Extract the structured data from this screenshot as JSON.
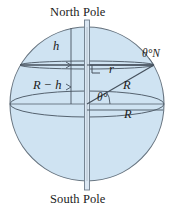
{
  "figure": {
    "name": "sphere-latitude-diagram",
    "colors": {
      "sphere_fill": "#cfe3f2",
      "outline": "#5a6a7a",
      "line": "#3f4a57",
      "axis_fill": "#dbe7f3",
      "text": "#1b1b1b"
    },
    "labels": {
      "north_pole": "North Pole",
      "south_pole": "South Pole",
      "height_above_latitude": "h",
      "distance_center_to_latitude": "R − h",
      "latitude_radius": "r",
      "sphere_radius_diagonal": "R",
      "sphere_radius_equator": "R",
      "latitude_angle_label": "θ°N",
      "center_angle": "θ°"
    },
    "geometry": {
      "sphere_center_x": 87,
      "sphere_center_y": 104,
      "sphere_radius": 77,
      "equator_ellipse_ry": 13,
      "latitude_ellipse_y": 65,
      "latitude_ellipse_rx": 67,
      "latitude_ellipse_ry": 4,
      "axis_top_y": 20,
      "axis_bottom_y": 190
    }
  }
}
